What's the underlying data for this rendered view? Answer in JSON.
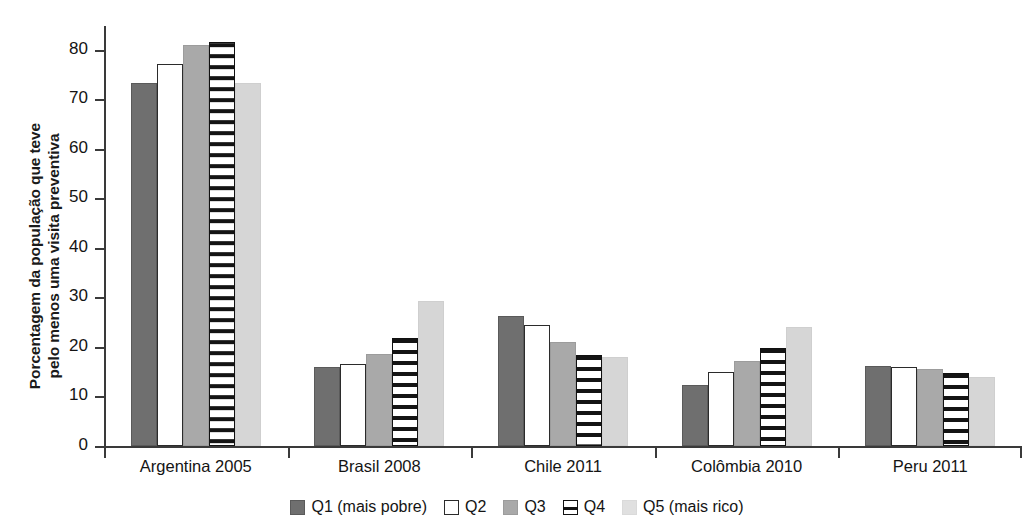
{
  "chart_data": {
    "type": "bar",
    "title": "",
    "subtitle": "",
    "xlabel": "",
    "ylabel_line1": "Porcentagem da população que teve",
    "ylabel_line2": "pelo menos uma visita preventiva",
    "ylim": [
      0,
      85
    ],
    "yticks": [
      "0",
      "10",
      "20",
      "30",
      "40",
      "50",
      "60",
      "70",
      "80"
    ],
    "ytick_values": [
      0,
      10,
      20,
      30,
      40,
      50,
      60,
      70,
      80
    ],
    "grid": false,
    "legend_position": "bottom",
    "categories": [
      "Argentina 2005",
      "Brasil 2008",
      "Chile 2011",
      "Colômbia 2010",
      "Peru 2011"
    ],
    "series": [
      {
        "name": "Q1 (mais pobre)",
        "key": "q1",
        "color": "#6f6f6f",
        "values": [
          73.3,
          16.0,
          26.2,
          12.4,
          16.2
        ]
      },
      {
        "name": "Q2",
        "key": "q2",
        "color": "#ffffff",
        "values": [
          77.2,
          16.5,
          24.5,
          15.0,
          16.0
        ]
      },
      {
        "name": "Q3",
        "key": "q3",
        "color": "#a9a9a9",
        "values": [
          81.0,
          18.5,
          20.9,
          17.2,
          15.5
        ]
      },
      {
        "name": "Q4",
        "key": "q4",
        "color": "#ffffff",
        "values": [
          81.6,
          21.8,
          18.3,
          19.7,
          14.7
        ]
      },
      {
        "name": "Q5 (mais rico)",
        "key": "q5",
        "color": "#d6d6d6",
        "values": [
          73.3,
          29.2,
          17.9,
          24.1,
          14.0
        ]
      }
    ]
  },
  "legend": {
    "items": [
      {
        "label": "Q1 (mais pobre)",
        "swatch": "q1"
      },
      {
        "label": "Q2",
        "swatch": "q2"
      },
      {
        "label": "Q3",
        "swatch": "q3"
      },
      {
        "label": "Q4",
        "swatch": "q4"
      },
      {
        "label": "Q5 (mais rico)",
        "swatch": "q5"
      }
    ]
  }
}
